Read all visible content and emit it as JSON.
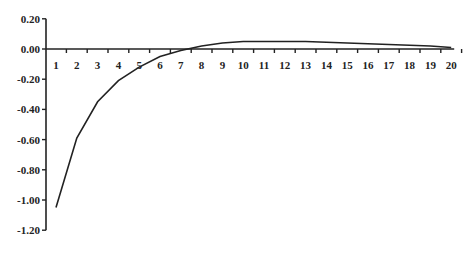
{
  "chart_data": {
    "type": "line",
    "title": "",
    "xlabel": "",
    "ylabel": "",
    "x": [
      1,
      2,
      3,
      4,
      5,
      6,
      7,
      8,
      9,
      10,
      11,
      12,
      13,
      14,
      15,
      16,
      17,
      18,
      19,
      20
    ],
    "series": [
      {
        "name": "response",
        "values": [
          -1.05,
          -0.59,
          -0.35,
          -0.21,
          -0.12,
          -0.05,
          -0.01,
          0.02,
          0.04,
          0.05,
          0.05,
          0.05,
          0.05,
          0.045,
          0.04,
          0.035,
          0.03,
          0.025,
          0.02,
          0.01
        ]
      }
    ],
    "ylim": [
      -1.2,
      0.2
    ],
    "yticks": [
      "0.20",
      "0.00",
      "-0.20",
      "-0.40",
      "-0.60",
      "-0.80",
      "-1.00",
      "-1.20"
    ],
    "xticks": [
      "1",
      "2",
      "3",
      "4",
      "5",
      "6",
      "7",
      "8",
      "9",
      "10",
      "11",
      "12",
      "13",
      "14",
      "15",
      "16",
      "17",
      "18",
      "19",
      "20"
    ],
    "grid": false,
    "legend": null,
    "line_color": "#222222"
  }
}
